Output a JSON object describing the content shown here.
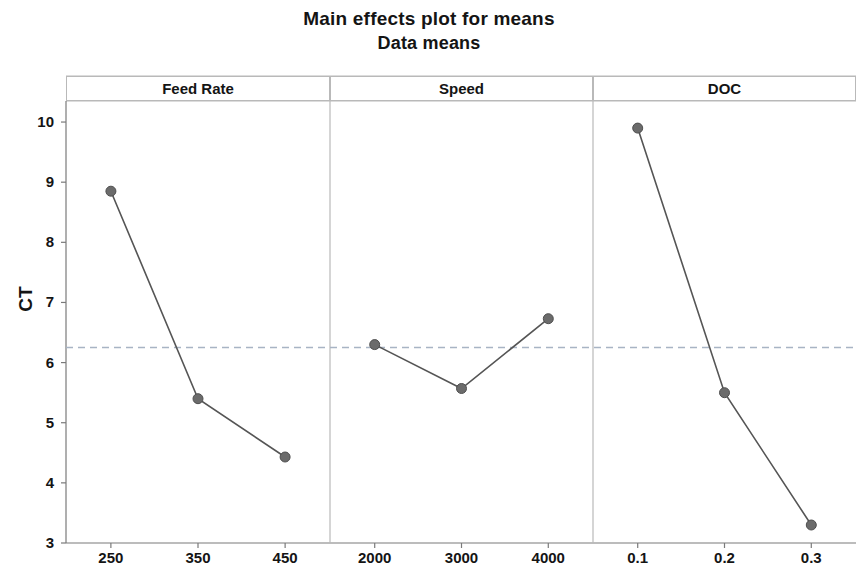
{
  "chart_data": {
    "type": "line",
    "title": "Main effects plot for means",
    "subtitle": "Data means",
    "ylabel": "CT",
    "xlabel": "",
    "ylim": [
      3,
      10.35
    ],
    "yticks": [
      3,
      4,
      5,
      6,
      7,
      8,
      9,
      10
    ],
    "ytick_labels": [
      "3",
      "4",
      "5",
      "6",
      "7",
      "8",
      "9",
      "10"
    ],
    "grid": false,
    "legend": "none",
    "reference_line": {
      "value": 6.25,
      "style": "dashed",
      "label": "grand mean"
    },
    "marker": {
      "shape": "circle",
      "color": "#6b6b6b",
      "size": 9
    },
    "line_color": "#555555",
    "panels": [
      {
        "name": "Feed Rate",
        "categories": [
          "250",
          "350",
          "450"
        ],
        "values": [
          8.85,
          5.4,
          4.43
        ]
      },
      {
        "name": "Speed",
        "categories": [
          "2000",
          "3000",
          "4000"
        ],
        "values": [
          6.3,
          5.57,
          6.73
        ]
      },
      {
        "name": "DOC",
        "categories": [
          "0.1",
          "0.2",
          "0.3"
        ],
        "values": [
          9.9,
          5.5,
          3.3
        ]
      }
    ]
  },
  "colors": {
    "axis": "#7a7a7a",
    "marker": "#6b6b6b",
    "line": "#555555",
    "reference": "#a8b4c4",
    "panel_border": "#b9b9b9",
    "text": "#141414"
  }
}
